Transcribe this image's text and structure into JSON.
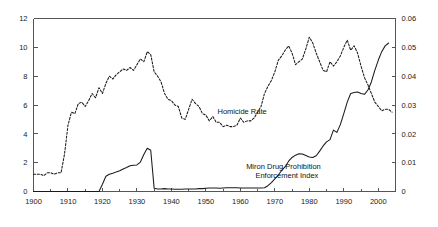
{
  "chart_data": {
    "type": "line",
    "title": "",
    "subtitle": "",
    "xlabel": "",
    "xlim": [
      1900,
      2005
    ],
    "grid": false,
    "legend_position": "inline-annotation",
    "axes": {
      "left": {
        "label": "",
        "ylim": [
          0,
          12
        ],
        "ticks": [
          "0",
          "2",
          "4",
          "6",
          "8",
          "10",
          "12"
        ],
        "tick_values": [
          0,
          2,
          4,
          6,
          8,
          10,
          12
        ]
      },
      "right": {
        "label": "",
        "ylim": [
          0,
          0.06
        ],
        "ticks": [
          "0",
          "0.01",
          "0.02",
          "0.03",
          "0.04",
          "0.05",
          "0.06"
        ],
        "tick_values": [
          0,
          0.01,
          0.02,
          0.03,
          0.04,
          0.05,
          0.06
        ]
      },
      "bottom": {
        "ticks": [
          "1900",
          "1910",
          "1920",
          "1930",
          "1940",
          "1950",
          "1960",
          "1970",
          "1980",
          "1990",
          "2000"
        ],
        "tick_values": [
          1900,
          1910,
          1920,
          1930,
          1940,
          1950,
          1960,
          1970,
          1980,
          1990,
          2000
        ],
        "minor_tick_step": 5
      }
    },
    "annotations": [
      {
        "name": "homicide-rate-label",
        "text": "Homicide Rate",
        "x": 1960.5,
        "y": 5.55,
        "axis": "left"
      },
      {
        "name": "miron-index-label",
        "text": "Miron Drug Prohibition",
        "x": 1972.5,
        "y": 1.72,
        "axis": "left"
      },
      {
        "name": "miron-index-label-line2",
        "text": "Enforcement Index",
        "x": 1973.5,
        "y": 1.08,
        "axis": "left"
      }
    ],
    "series": [
      {
        "name": "Homicide Rate",
        "axis": "left",
        "style": "dashed",
        "color": "#1a1a1a",
        "x": [
          1900,
          1901,
          1902,
          1903,
          1904,
          1905,
          1906,
          1907,
          1908,
          1909,
          1910,
          1911,
          1912,
          1913,
          1914,
          1915,
          1916,
          1917,
          1918,
          1919,
          1920,
          1921,
          1922,
          1923,
          1924,
          1925,
          1926,
          1927,
          1928,
          1929,
          1930,
          1931,
          1932,
          1933,
          1934,
          1935,
          1936,
          1937,
          1938,
          1939,
          1940,
          1941,
          1942,
          1943,
          1944,
          1945,
          1946,
          1947,
          1948,
          1949,
          1950,
          1951,
          1952,
          1953,
          1954,
          1955,
          1956,
          1957,
          1958,
          1959,
          1960,
          1961,
          1962,
          1963,
          1964,
          1965,
          1966,
          1967,
          1968,
          1969,
          1970,
          1971,
          1972,
          1973,
          1974,
          1975,
          1976,
          1977,
          1978,
          1979,
          1980,
          1981,
          1982,
          1983,
          1984,
          1985,
          1986,
          1987,
          1988,
          1989,
          1990,
          1991,
          1992,
          1993,
          1994,
          1995,
          1996,
          1997,
          1998,
          1999,
          2000,
          2001,
          2002,
          2003,
          2004
        ],
        "values": [
          1.2,
          1.2,
          1.2,
          1.1,
          1.3,
          1.3,
          1.2,
          1.3,
          1.3,
          2.6,
          4.6,
          5.5,
          5.4,
          6.1,
          6.2,
          5.9,
          6.3,
          6.8,
          6.5,
          7.2,
          6.8,
          7.5,
          8.0,
          7.8,
          8.1,
          8.3,
          8.5,
          8.4,
          8.6,
          8.4,
          8.8,
          9.2,
          9.0,
          9.7,
          9.5,
          8.3,
          8.0,
          7.6,
          6.8,
          6.4,
          6.3,
          6.0,
          5.9,
          5.1,
          5.0,
          5.7,
          6.4,
          6.1,
          5.9,
          5.4,
          5.3,
          4.9,
          5.2,
          4.8,
          4.8,
          4.5,
          4.6,
          4.5,
          4.5,
          4.6,
          5.1,
          4.8,
          4.9,
          4.9,
          5.1,
          5.5,
          5.9,
          6.8,
          7.3,
          7.7,
          8.3,
          9.1,
          9.4,
          9.8,
          10.1,
          9.6,
          8.8,
          9.0,
          9.2,
          9.9,
          10.7,
          10.3,
          9.6,
          9.0,
          8.4,
          8.3,
          9.0,
          8.7,
          9.0,
          9.4,
          10.0,
          10.5,
          9.8,
          10.1,
          9.6,
          8.7,
          7.9,
          7.4,
          6.8,
          6.2,
          5.9,
          5.6,
          5.7,
          5.7,
          5.5
        ]
      },
      {
        "name": "Miron Drug Prohibition Enforcement Index",
        "axis": "right",
        "style": "solid",
        "color": "#1a1a1a",
        "x": [
          1900,
          1905,
          1910,
          1915,
          1919,
          1920,
          1921,
          1922,
          1923,
          1924,
          1925,
          1926,
          1927,
          1928,
          1929,
          1930,
          1931,
          1932,
          1933,
          1934,
          1935,
          1936,
          1937,
          1938,
          1939,
          1940,
          1941,
          1942,
          1943,
          1944,
          1945,
          1946,
          1947,
          1948,
          1949,
          1950,
          1951,
          1952,
          1953,
          1954,
          1955,
          1956,
          1957,
          1958,
          1959,
          1960,
          1961,
          1962,
          1963,
          1964,
          1965,
          1966,
          1967,
          1968,
          1969,
          1970,
          1971,
          1972,
          1973,
          1974,
          1975,
          1976,
          1977,
          1978,
          1979,
          1980,
          1981,
          1982,
          1983,
          1984,
          1985,
          1986,
          1987,
          1988,
          1989,
          1990,
          1991,
          1992,
          1993,
          1994,
          1995,
          1996,
          1997,
          1998,
          1999,
          2000,
          2001,
          2002,
          2003
        ],
        "values": [
          0.0,
          0.0,
          0.0,
          0.0,
          0.0,
          0.0025,
          0.0053,
          0.006,
          0.0063,
          0.0068,
          0.0072,
          0.0078,
          0.0083,
          0.0089,
          0.0091,
          0.0092,
          0.0102,
          0.0128,
          0.015,
          0.0143,
          0.0011,
          0.0009,
          0.0009,
          0.001,
          0.0009,
          0.0009,
          0.0008,
          0.0008,
          0.0008,
          0.0009,
          0.0009,
          0.0009,
          0.0009,
          0.001,
          0.001,
          0.0011,
          0.0012,
          0.0012,
          0.0012,
          0.0011,
          0.0012,
          0.0013,
          0.0013,
          0.0013,
          0.0013,
          0.0012,
          0.0012,
          0.0012,
          0.0012,
          0.0012,
          0.0012,
          0.0012,
          0.0013,
          0.002,
          0.0031,
          0.0044,
          0.0057,
          0.0073,
          0.0086,
          0.0105,
          0.0118,
          0.0126,
          0.0131,
          0.013,
          0.0125,
          0.012,
          0.0118,
          0.0124,
          0.014,
          0.0158,
          0.0172,
          0.018,
          0.0213,
          0.0205,
          0.0232,
          0.027,
          0.031,
          0.034,
          0.0343,
          0.0345,
          0.034,
          0.0337,
          0.0352,
          0.038,
          0.042,
          0.0455,
          0.0485,
          0.0505,
          0.0515
        ]
      }
    ]
  }
}
